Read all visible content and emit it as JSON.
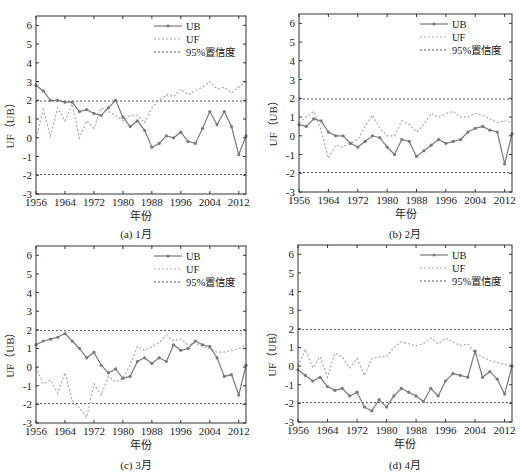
{
  "figure": {
    "x_tick_labels": [
      "1956",
      "1964",
      "1972",
      "1980",
      "1988",
      "1996",
      "2004",
      "2012"
    ],
    "y_tick_labels": [
      "-3",
      "-2",
      "-1",
      "0",
      "1",
      "2",
      "3",
      "4",
      "5",
      "6"
    ],
    "xlabel": "年份",
    "ylabel": "UF（UB）",
    "legend": [
      "UB",
      "UF",
      "95%置信度"
    ],
    "colors": {
      "axis": "#333333",
      "ub": "#7a7a7a",
      "uf": "#a8a8a8",
      "conf": "#555555"
    }
  },
  "captions": {
    "a": "(a) 1月",
    "b": "(b) 2月",
    "c": "(c) 3月",
    "d": "(d) 4月"
  },
  "chart_data": [
    {
      "type": "line",
      "title": "(a) 1月",
      "xlabel": "年份",
      "ylabel": "UF（UB）",
      "xlim": [
        1956,
        2014
      ],
      "ylim": [
        -3,
        6.5
      ],
      "x_ticks": [
        1956,
        1964,
        1972,
        1980,
        1988,
        1996,
        2004,
        2012
      ],
      "y_ticks": [
        -3,
        -2,
        -1,
        0,
        1,
        2,
        3,
        4,
        5,
        6
      ],
      "legend_position": "upper right",
      "confidence_levels": [
        1.96,
        -1.96
      ],
      "x": [
        1956,
        1958,
        1960,
        1962,
        1964,
        1966,
        1968,
        1970,
        1972,
        1974,
        1976,
        1978,
        1980,
        1982,
        1984,
        1986,
        1988,
        1990,
        1992,
        1994,
        1996,
        1998,
        2000,
        2002,
        2004,
        2006,
        2008,
        2010,
        2012,
        2014
      ],
      "series": [
        {
          "name": "UB",
          "values": [
            2.8,
            2.5,
            2.0,
            2.0,
            1.9,
            1.9,
            1.4,
            1.5,
            1.3,
            1.2,
            1.6,
            2.0,
            1.1,
            0.6,
            0.9,
            0.4,
            -0.5,
            -0.3,
            0.1,
            0.0,
            0.3,
            -0.2,
            -0.3,
            0.5,
            1.4,
            0.7,
            1.4,
            0.6,
            -0.9,
            0.1
          ]
        },
        {
          "name": "UF",
          "values": [
            0.0,
            1.5,
            0.1,
            1.6,
            0.9,
            1.8,
            0.0,
            0.9,
            0.5,
            1.6,
            1.4,
            1.2,
            0.9,
            1.2,
            1.2,
            0.8,
            1.6,
            2.0,
            2.3,
            2.2,
            2.6,
            2.3,
            2.5,
            2.7,
            3.0,
            2.6,
            2.7,
            2.4,
            2.7,
            3.0
          ]
        }
      ]
    },
    {
      "type": "line",
      "title": "(b) 2月",
      "xlabel": "年份",
      "ylabel": "UF（UB）",
      "xlim": [
        1956,
        2014
      ],
      "ylim": [
        -3,
        6.5
      ],
      "x_ticks": [
        1956,
        1964,
        1972,
        1980,
        1988,
        1996,
        2004,
        2012
      ],
      "y_ticks": [
        -3,
        -2,
        -1,
        0,
        1,
        2,
        3,
        4,
        5,
        6
      ],
      "legend_position": "upper right",
      "confidence_levels": [
        1.96,
        -1.96
      ],
      "x": [
        1956,
        1958,
        1960,
        1962,
        1964,
        1966,
        1968,
        1970,
        1972,
        1974,
        1976,
        1978,
        1980,
        1982,
        1984,
        1986,
        1988,
        1990,
        1992,
        1994,
        1996,
        1998,
        2000,
        2002,
        2004,
        2006,
        2008,
        2010,
        2012,
        2014
      ],
      "series": [
        {
          "name": "UB",
          "values": [
            0.6,
            0.5,
            0.9,
            0.8,
            0.2,
            0.0,
            0.0,
            -0.4,
            -0.6,
            -0.3,
            0.0,
            -0.1,
            -0.6,
            -1.0,
            -0.2,
            -0.3,
            -1.1,
            -0.8,
            -0.5,
            -0.2,
            -0.4,
            -0.3,
            -0.2,
            0.2,
            0.4,
            0.5,
            0.3,
            0.2,
            -1.5,
            0.1
          ]
        },
        {
          "name": "UF",
          "values": [
            0.7,
            1.0,
            1.3,
            0.3,
            -1.2,
            -0.5,
            -0.6,
            -0.4,
            -0.2,
            0.5,
            1.1,
            0.4,
            0.0,
            0.0,
            0.8,
            0.6,
            0.2,
            0.6,
            1.2,
            1.0,
            1.2,
            1.3,
            1.0,
            1.0,
            1.2,
            1.1,
            0.9,
            0.7,
            0.8,
            0.7
          ]
        }
      ]
    },
    {
      "type": "line",
      "title": "(c) 3月",
      "xlabel": "年份",
      "ylabel": "UF（UB）",
      "xlim": [
        1956,
        2014
      ],
      "ylim": [
        -3,
        6.5
      ],
      "x_ticks": [
        1956,
        1964,
        1972,
        1980,
        1988,
        1996,
        2004,
        2012
      ],
      "y_ticks": [
        -3,
        -2,
        -1,
        0,
        1,
        2,
        3,
        4,
        5,
        6
      ],
      "legend_position": "upper right",
      "confidence_levels": [
        1.96,
        -1.96
      ],
      "x": [
        1956,
        1958,
        1960,
        1962,
        1964,
        1966,
        1968,
        1970,
        1972,
        1974,
        1976,
        1978,
        1980,
        1982,
        1984,
        1986,
        1988,
        1990,
        1992,
        1994,
        1996,
        1998,
        2000,
        2002,
        2004,
        2006,
        2008,
        2010,
        2012,
        2014
      ],
      "series": [
        {
          "name": "UB",
          "values": [
            1.2,
            1.4,
            1.5,
            1.6,
            1.8,
            1.4,
            1.0,
            0.5,
            0.8,
            0.1,
            -0.3,
            -0.1,
            -0.6,
            -0.5,
            0.3,
            0.5,
            0.2,
            0.5,
            0.3,
            1.2,
            0.9,
            1.0,
            1.4,
            1.2,
            1.1,
            0.5,
            -0.5,
            -0.4,
            -1.5,
            0.1
          ]
        },
        {
          "name": "UF",
          "values": [
            0.0,
            -0.9,
            -0.7,
            -1.4,
            -0.3,
            -1.8,
            -2.2,
            -2.7,
            -0.9,
            -1.5,
            -0.5,
            -0.8,
            -0.6,
            0.1,
            1.1,
            0.9,
            1.1,
            1.3,
            1.7,
            1.4,
            1.5,
            1.2,
            1.3,
            1.1,
            1.0,
            0.8,
            0.8,
            0.9,
            1.0,
            1.2
          ]
        }
      ]
    },
    {
      "type": "line",
      "title": "(d) 4月",
      "xlabel": "年份",
      "ylabel": "UF（UB）",
      "xlim": [
        1956,
        2014
      ],
      "ylim": [
        -3,
        6.5
      ],
      "x_ticks": [
        1956,
        1964,
        1972,
        1980,
        1988,
        1996,
        2004,
        2012
      ],
      "y_ticks": [
        -3,
        -2,
        -1,
        0,
        1,
        2,
        3,
        4,
        5,
        6
      ],
      "legend_position": "upper right",
      "confidence_levels": [
        1.96,
        -1.96
      ],
      "x": [
        1956,
        1958,
        1960,
        1962,
        1964,
        1966,
        1968,
        1970,
        1972,
        1974,
        1976,
        1978,
        1980,
        1982,
        1984,
        1986,
        1988,
        1990,
        1992,
        1994,
        1996,
        1998,
        2000,
        2002,
        2004,
        2006,
        2008,
        2010,
        2012,
        2014
      ],
      "series": [
        {
          "name": "UB",
          "values": [
            -0.2,
            -0.5,
            -0.8,
            -0.6,
            -1.1,
            -1.3,
            -1.2,
            -1.6,
            -1.4,
            -2.2,
            -2.4,
            -1.8,
            -2.2,
            -1.6,
            -1.2,
            -1.4,
            -1.6,
            -1.9,
            -1.2,
            -1.6,
            -0.8,
            -0.4,
            -0.5,
            -0.6,
            0.8,
            -0.6,
            -0.3,
            -0.7,
            -1.5,
            0.0
          ]
        },
        {
          "name": "UF",
          "values": [
            0.0,
            0.9,
            -0.1,
            0.5,
            -0.6,
            0.7,
            0.5,
            -0.1,
            0.4,
            -0.5,
            0.4,
            0.5,
            0.5,
            1.0,
            1.3,
            1.2,
            1.1,
            1.2,
            1.5,
            1.2,
            1.5,
            1.3,
            1.1,
            1.2,
            0.7,
            0.5,
            0.3,
            0.2,
            0.1,
            0.1
          ]
        }
      ]
    }
  ]
}
